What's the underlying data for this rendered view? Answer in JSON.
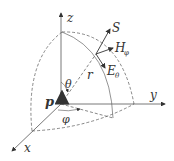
{
  "diagram": {
    "axes": {
      "z": "z",
      "y": "y",
      "x": "x"
    },
    "labels": {
      "dipole": "p",
      "poynting": "S",
      "h_field": "H",
      "h_sub": "φ",
      "e_field": "E",
      "e_sub": "θ",
      "radius": "r",
      "polar_angle": "θ",
      "azimuth_angle": "φ"
    },
    "colors": {
      "line": "#333333",
      "dashed": "#555555",
      "background": "#ffffff"
    }
  }
}
